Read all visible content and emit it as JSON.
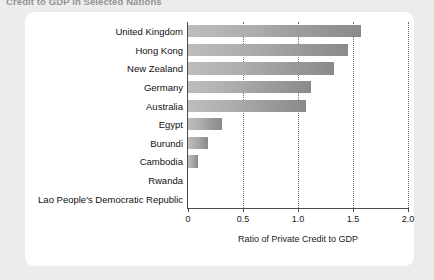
{
  "document": {
    "title": "Credit to GDP in Selected Nations"
  },
  "chart_data": {
    "type": "bar",
    "orientation": "horizontal",
    "title": "Credit to GDP in Selected Nations",
    "xlabel": "Ratio of Private Credit to GDP",
    "ylabel": "",
    "xlim": [
      0,
      2.0
    ],
    "xticks": [
      "0",
      "0.5",
      "1.0",
      "1.5",
      "2.0"
    ],
    "xtick_values": [
      0,
      0.5,
      1.0,
      1.5,
      2.0
    ],
    "grid": "vertical dotted gridlines at 0.5, 1.0, 1.5, 2.0",
    "legend": "none",
    "bar_fill": "light-to-dark gray horizontal gradient",
    "categories": [
      "United Kingdom",
      "Hong Kong",
      "New Zealand",
      "Germany",
      "Australia",
      "Egypt",
      "Burundi",
      "Cambodia",
      "Rwanda",
      "Lao People's Democratic Republic"
    ],
    "values": [
      1.57,
      1.45,
      1.33,
      1.12,
      1.07,
      0.31,
      0.18,
      0.09,
      0.0,
      0.0
    ]
  },
  "colors": {
    "page_background": "#ececed",
    "panel_background": "#ffffff",
    "axis": "#4d4d4d",
    "gridline": "#6e6e6e",
    "bar_light": "#bdbdbd",
    "bar_dark": "#8a8a8a",
    "text": "#111111"
  }
}
